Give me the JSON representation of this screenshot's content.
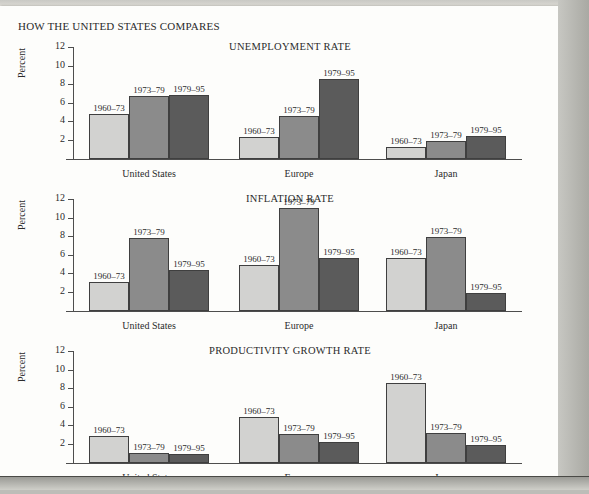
{
  "figure": {
    "heading": "HOW THE UNITED STATES COMPARES",
    "y_axis_label": "Percent",
    "y_ticks": [
      2,
      4,
      6,
      8,
      10,
      12
    ],
    "y_max": 12,
    "groups": [
      "United States",
      "Europe",
      "Japan"
    ],
    "series": [
      "1960–73",
      "1973–79",
      "1979–95"
    ],
    "series_colors": [
      "#d2d2d0",
      "#8b8b8b",
      "#5b5b5b"
    ]
  },
  "chart_data": [
    {
      "type": "bar",
      "title": "UNEMPLOYMENT RATE",
      "xlabel": "",
      "ylabel": "Percent",
      "ylim": [
        0,
        12
      ],
      "yticks": [
        2,
        4,
        6,
        8,
        10,
        12
      ],
      "grid": false,
      "legend": "in-bar-labels",
      "categories": [
        "United States",
        "Europe",
        "Japan"
      ],
      "series": [
        {
          "name": "1960–73",
          "values": [
            4.9,
            2.4,
            1.3
          ]
        },
        {
          "name": "1973–79",
          "values": [
            6.8,
            4.6,
            1.9
          ]
        },
        {
          "name": "1979–95",
          "values": [
            6.9,
            8.6,
            2.5
          ]
        }
      ]
    },
    {
      "type": "bar",
      "title": "INFLATION RATE",
      "xlabel": "",
      "ylabel": "Percent",
      "ylim": [
        0,
        12
      ],
      "yticks": [
        2,
        4,
        6,
        8,
        10,
        12
      ],
      "grid": false,
      "legend": "in-bar-labels",
      "categories": [
        "United States",
        "Europe",
        "Japan"
      ],
      "series": [
        {
          "name": "1960–73",
          "values": [
            3.1,
            5.0,
            5.7
          ]
        },
        {
          "name": "1973–79",
          "values": [
            7.9,
            11.1,
            8.0
          ]
        },
        {
          "name": "1979–95",
          "values": [
            4.4,
            5.7,
            2.0
          ]
        }
      ]
    },
    {
      "type": "bar",
      "title": "PRODUCTIVITY GROWTH RATE",
      "xlabel": "",
      "ylabel": "Percent",
      "ylim": [
        0,
        12
      ],
      "yticks": [
        2,
        4,
        6,
        8,
        10,
        12
      ],
      "grid": false,
      "legend": "in-bar-labels",
      "categories": [
        "United States",
        "Europe",
        "Japan"
      ],
      "series": [
        {
          "name": "1960–73",
          "values": [
            2.9,
            5.0,
            8.6
          ]
        },
        {
          "name": "1973–79",
          "values": [
            1.1,
            3.1,
            3.2
          ]
        },
        {
          "name": "1979–95",
          "values": [
            1.0,
            2.3,
            1.9
          ]
        }
      ]
    }
  ]
}
